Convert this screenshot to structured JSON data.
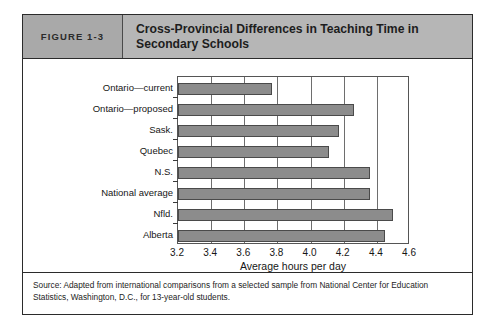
{
  "figure": {
    "number_label": "FIGURE 1-3",
    "title": "Cross-Provincial Differences in Teaching Time in Secondary Schools",
    "source_note": "Source: Adapted from international comparisons from a selected sample from National Center for Education Statistics, Washington, D.C., for 13-year-old students."
  },
  "colors": {
    "header_band": "#b6b6b6",
    "figure_number_cell": "#a9a9a9",
    "bar_fill": "#8c8c8c",
    "bar_stroke": "#4a4a4a",
    "frame": "#2b2b2b",
    "gridline": "#6e6e6e"
  },
  "chart_data": {
    "type": "bar",
    "orientation": "horizontal",
    "title": "Cross-Provincial Differences in Teaching Time in Secondary Schools",
    "xlabel": "Average hours per day",
    "ylabel": "",
    "xlim": [
      3.2,
      4.6
    ],
    "xticks": [
      "3.2",
      "3.4",
      "3.6",
      "3.8",
      "4.0",
      "4.2",
      "4.4",
      "4.6"
    ],
    "xtick_values": [
      3.2,
      3.4,
      3.6,
      3.8,
      4.0,
      4.2,
      4.4,
      4.6
    ],
    "grid": true,
    "legend": "none",
    "categories": [
      "Ontario—current",
      "Ontario—proposed",
      "Sask.",
      "Quebec",
      "N.S.",
      "National average",
      "Nfld.",
      "Alberta"
    ],
    "values": [
      3.77,
      4.26,
      4.17,
      4.11,
      4.36,
      4.36,
      4.5,
      4.45
    ]
  }
}
